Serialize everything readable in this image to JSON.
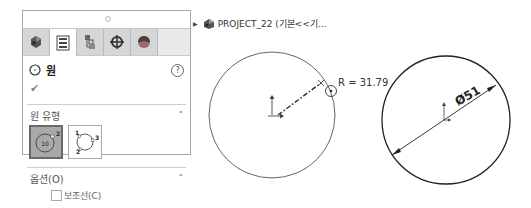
{
  "panel": {
    "grip_icon": "grip-dot-icon",
    "tabs": [
      {
        "name": "feature-manager",
        "icon": "feature-manager-icon",
        "active": false
      },
      {
        "name": "property-manager",
        "icon": "property-manager-icon",
        "active": true
      },
      {
        "name": "configuration-manager",
        "icon": "configuration-manager-icon",
        "active": false
      },
      {
        "name": "dimxpert-manager",
        "icon": "crosshair-icon",
        "active": false
      },
      {
        "name": "display-manager",
        "icon": "display-manager-icon",
        "active": false
      }
    ],
    "title": "원",
    "help_label": "?",
    "ok_label": "✔",
    "circle_type_section": {
      "label": "원 유형",
      "collapse_icon": "chevron-up-icon",
      "types": [
        {
          "name": "center-circle",
          "label_center": "10",
          "label_point": "2",
          "active": true
        },
        {
          "name": "perimeter-circle",
          "labels": [
            "1",
            "2",
            "3"
          ],
          "active": false
        }
      ]
    },
    "options_section": {
      "label": "옵션(O)",
      "collapse_icon": "chevron-up-icon",
      "construction_checkbox": {
        "label": "보조선(C)",
        "checked": false
      }
    }
  },
  "tree": {
    "expand_icon": "triangle-right-icon",
    "part_icon": "part-icon",
    "name": "PROJECT_22  (기본<<기..."
  },
  "sketch": {
    "left_circle": {
      "radius_label": "R = 31.79"
    },
    "right_circle": {
      "diameter_label": "Ø51"
    }
  }
}
